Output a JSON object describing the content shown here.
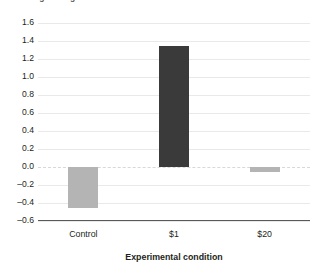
{
  "chart_data": {
    "type": "bar",
    "title": "",
    "ytitle_clipped": "Average rating",
    "xlabel": "Experimental condition",
    "ylabel": "",
    "categories": [
      "Control",
      "$1",
      "$20"
    ],
    "values": [
      -0.45,
      1.35,
      -0.05
    ],
    "series": [
      {
        "name": "Effect",
        "values": [
          -0.45,
          1.35,
          -0.05
        ]
      }
    ],
    "ylim": [
      -0.6,
      1.6
    ],
    "yticks": [
      "1.6",
      "1.4",
      "1.2",
      "1.0",
      "0.8",
      "0.6",
      "0.4",
      "0.2",
      "0.0",
      "–0.2",
      "–0.4",
      "–0.6"
    ],
    "ytick_values": [
      1.6,
      1.4,
      1.2,
      1.0,
      0.8,
      0.6,
      0.4,
      0.2,
      0.0,
      -0.2,
      -0.4,
      -0.6
    ],
    "grid": true,
    "legend": "none",
    "bar_colors": [
      "#b4b4b4",
      "#3a3a3a",
      "#b4b4b4"
    ],
    "colors": {
      "bar_light": "#b4b4b4",
      "bar_dark": "#3a3a3a",
      "gridline": "#e9e9ea",
      "zero_line": "#d8d8d8",
      "axis_line": "#58595b",
      "text": "#231f20",
      "background": "#ffffff"
    }
  }
}
